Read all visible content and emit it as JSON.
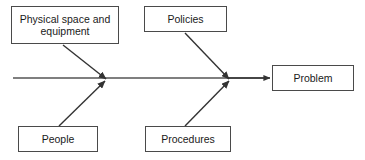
{
  "diagram": {
    "type": "fishbone-ishikawa",
    "title": "",
    "background_color": "#ffffff",
    "line_color": "#333333",
    "box_border_color": "#4a4a4a",
    "text_color": "#1a1a1a",
    "effect": {
      "label": "Problem"
    },
    "causes": [
      {
        "id": "physical-space",
        "label": "Physical space and equipment",
        "position": "top-left"
      },
      {
        "id": "policies",
        "label": "Policies",
        "position": "top-right"
      },
      {
        "id": "people",
        "label": "People",
        "position": "bottom-left"
      },
      {
        "id": "procedures",
        "label": "Procedures",
        "position": "bottom-right"
      }
    ],
    "spine": {
      "start_x": 13,
      "end_x": 270,
      "y": 78,
      "junctions": [
        105,
        228
      ]
    }
  }
}
